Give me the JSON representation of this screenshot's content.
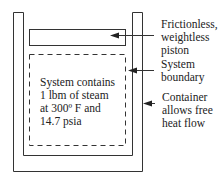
{
  "diagram": {
    "system_text": [
      "System contains",
      "1 lbm of steam",
      "at 300º F and",
      "14.7 psia"
    ],
    "labels": {
      "piston": [
        "Frictionless,",
        "weightless",
        "piston"
      ],
      "boundary": [
        "System",
        "boundary"
      ],
      "container": [
        "Container",
        "allows free",
        "heat flow"
      ]
    },
    "colors": {
      "stroke": "#333333",
      "text": "#222222",
      "background": "#ffffff"
    }
  }
}
